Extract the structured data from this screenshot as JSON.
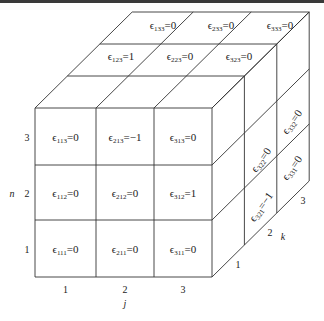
{
  "figure": {
    "symbol": "ϵ",
    "front_face": [
      {
        "sub": "113",
        "val": "0",
        "j": 1,
        "n": 3
      },
      {
        "sub": "213",
        "val": "−1",
        "j": 2,
        "n": 3
      },
      {
        "sub": "313",
        "val": "0",
        "j": 3,
        "n": 3
      },
      {
        "sub": "112",
        "val": "0",
        "j": 1,
        "n": 2
      },
      {
        "sub": "212",
        "val": "0",
        "j": 2,
        "n": 2
      },
      {
        "sub": "312",
        "val": "1",
        "j": 3,
        "n": 2
      },
      {
        "sub": "111",
        "val": "0",
        "j": 1,
        "n": 1
      },
      {
        "sub": "211",
        "val": "0",
        "j": 2,
        "n": 1
      },
      {
        "sub": "311",
        "val": "0",
        "j": 3,
        "n": 1
      }
    ],
    "top_face": [
      {
        "sub": "133",
        "val": "0"
      },
      {
        "sub": "233",
        "val": "0"
      },
      {
        "sub": "333",
        "val": "0"
      },
      {
        "sub": "123",
        "val": "1"
      },
      {
        "sub": "223",
        "val": "0"
      },
      {
        "sub": "323",
        "val": "0"
      }
    ],
    "side_face": [
      {
        "sub": "322",
        "val": "0"
      },
      {
        "sub": "332",
        "val": "0"
      },
      {
        "sub": "321",
        "val": "−1"
      },
      {
        "sub": "331",
        "val": "0"
      }
    ],
    "axes": {
      "j": {
        "name": "j",
        "ticks": [
          "1",
          "2",
          "3"
        ]
      },
      "n": {
        "name": "n",
        "ticks": [
          "1",
          "2",
          "3"
        ]
      },
      "k": {
        "name": "k",
        "ticks": [
          "1",
          "2",
          "3"
        ]
      }
    }
  }
}
